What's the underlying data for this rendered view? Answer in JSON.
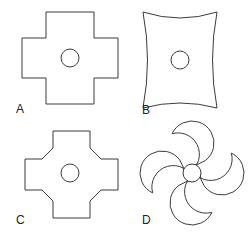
{
  "figure": {
    "background_color": "#ffffff",
    "stroke_color": "#3b3b3b",
    "fill_color": "#ffffff",
    "width": 250,
    "height": 237,
    "panel_count": 4
  },
  "panels": [
    {
      "label": "A",
      "label_x": 16,
      "label_y": 113,
      "shape_name": "plus-cross",
      "description": "Greek cross / plus sign with square right-angle corners",
      "center_x": 70,
      "center_y": 58,
      "hole_radius": 9,
      "outline_points": "46,12 94,12 94,38 118,38 118,78 94,78 94,104 46,104 46,78 22,78 22,38 46,38",
      "arm_width": 48,
      "span": 96
    },
    {
      "label": "B",
      "label_x": 142,
      "label_y": 114,
      "shape_name": "four-point-concave-star",
      "description": "Four pointed star with concave sides, vertices at corners",
      "center_x": 180,
      "center_y": 60,
      "hole_radius": 9,
      "outline_path": "M 143,12 Q 152,60 143,108 Q 180,98 217,108 Q 208,60 217,12 Q 180,24 143,12 Z",
      "tip_count": 4
    },
    {
      "label": "C",
      "label_x": 16,
      "label_y": 224,
      "shape_name": "chamfered-cross",
      "description": "Cross with 45-degree chamfered inner corners",
      "center_x": 70,
      "center_y": 173,
      "hole_radius": 9,
      "outline_points": "53,131 90,131 90,148 101,159 118,159 118,190 101,190 90,201 90,218 53,218 53,201 42,190 25,190 25,159 42,159 53,148",
      "chamfer_size": 11
    },
    {
      "label": "D",
      "label_x": 142,
      "label_y": 224,
      "shape_name": "four-lobe-clover",
      "description": "Rounded cross / quatrefoil with four circular lobes joined by concave fillets",
      "center_x": 192,
      "center_y": 173,
      "hole_radius": 9,
      "lobe_radius": 22,
      "lobe_offset": 30,
      "fillet_radius": 9,
      "lobe_count": 4
    }
  ],
  "legend": {
    "hole_description": "central circular through-hole",
    "shapes_list": [
      "A",
      "B",
      "C",
      "D"
    ]
  }
}
